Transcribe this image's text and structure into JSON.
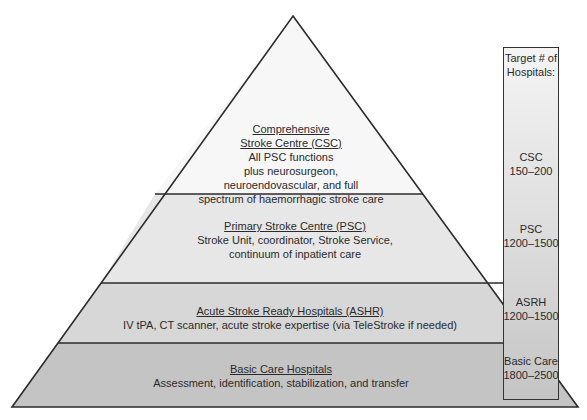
{
  "diagram": {
    "type": "pyramid",
    "tiers": [
      {
        "id": "csc",
        "title_lines": [
          "Comprehensive",
          "Stroke Centre (CSC)"
        ],
        "desc_lines": [
          "All PSC functions",
          "plus neurosurgeon,",
          "neuroendovascular, and full",
          "spectrum of haemorrhagic stroke care"
        ],
        "fill": "#f6f6f6"
      },
      {
        "id": "psc",
        "title_lines": [
          "Primary Stroke Centre (PSC)"
        ],
        "desc_lines": [
          "Stroke Unit, coordinator, Stroke Service,",
          "continuum of inpatient care"
        ],
        "fill": "#e6e6e6"
      },
      {
        "id": "ashr",
        "title_lines": [
          "Acute Stroke Ready Hospitals (ASHR)"
        ],
        "desc_lines": [
          "IV tPA, CT scanner, acute stroke expertise (via TeleStroke if needed)"
        ],
        "fill": "#d6d6d6"
      },
      {
        "id": "basic",
        "title_lines": [
          "Basic Care Hospitals"
        ],
        "desc_lines": [
          "Assessment, identification, stabilization, and transfer"
        ],
        "fill": "#c3c3c3"
      }
    ],
    "target_column": {
      "header_lines": [
        "Target # of",
        "Hospitals:"
      ],
      "entries": [
        {
          "label": "CSC",
          "range": "150–200"
        },
        {
          "label": "PSC",
          "range": "1200–1500"
        },
        {
          "label": "ASRH",
          "range": "1200–1500"
        },
        {
          "label": "Basic Care",
          "range": "1800–2500"
        }
      ]
    },
    "colors": {
      "outline": "#2b2b2b",
      "text": "#2a2a2a"
    }
  }
}
